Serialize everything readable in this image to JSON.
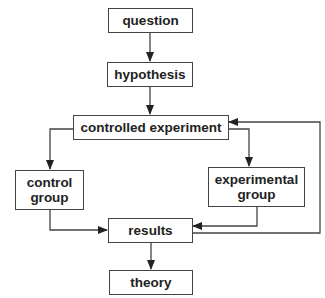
{
  "diagram": {
    "nodes": {
      "question": "question",
      "hypothesis": "hypothesis",
      "controlled_experiment": "controlled experiment",
      "control_group_line1": "control",
      "control_group_line2": "group",
      "experimental_group_line1": "experimental",
      "experimental_group_line2": "group",
      "results": "results",
      "theory": "theory"
    },
    "edges": [
      {
        "from": "question",
        "to": "hypothesis"
      },
      {
        "from": "hypothesis",
        "to": "controlled experiment"
      },
      {
        "from": "controlled experiment",
        "to": "control group"
      },
      {
        "from": "controlled experiment",
        "to": "experimental group"
      },
      {
        "from": "control group",
        "to": "results"
      },
      {
        "from": "experimental group",
        "to": "results"
      },
      {
        "from": "results",
        "to": "controlled experiment",
        "type": "feedback"
      },
      {
        "from": "results",
        "to": "theory"
      }
    ],
    "colors": {
      "stroke": "#444444",
      "text": "#222222",
      "background": "#ffffff"
    }
  }
}
